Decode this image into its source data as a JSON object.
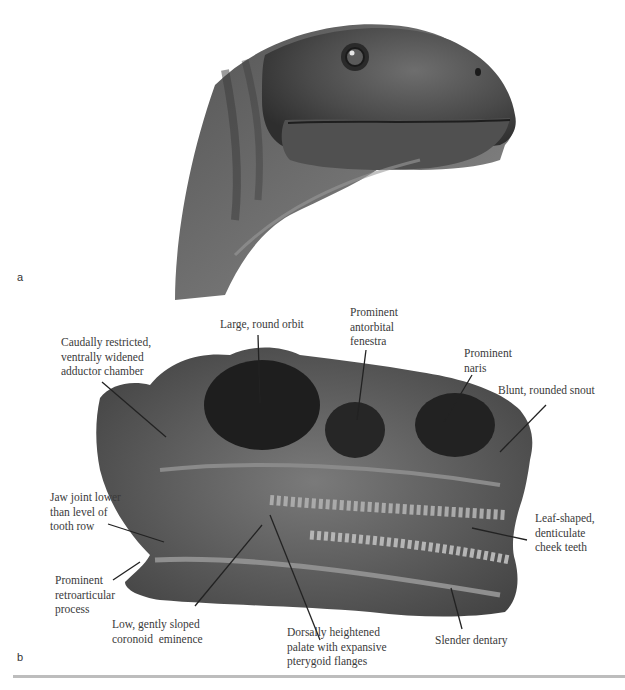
{
  "figure": {
    "panels": [
      {
        "label": "a",
        "content": "life reconstruction of dinosaur head (grayscale illustration)"
      },
      {
        "label": "b",
        "content": "fossil skull in lateral view with anatomical callouts"
      }
    ],
    "panel_a": {
      "label": "a"
    },
    "panel_b": {
      "label": "b",
      "callouts": [
        {
          "id": "adductor",
          "text": "Caudally restricted,\nventrally widened\nadductor chamber"
        },
        {
          "id": "orbit",
          "text": "Large, round orbit"
        },
        {
          "id": "antorbital",
          "text": "Prominent\nantorbital\nfenestra"
        },
        {
          "id": "naris",
          "text": "Prominent\nnaris"
        },
        {
          "id": "snout",
          "text": "Blunt, rounded snout"
        },
        {
          "id": "jaw-joint",
          "text": "Jaw joint lower\nthan level of\ntooth row"
        },
        {
          "id": "cheek-teeth",
          "text": "Leaf-shaped,\ndenticulate\ncheek teeth"
        },
        {
          "id": "retroarticular",
          "text": "Prominent\nretroarticular\nprocess"
        },
        {
          "id": "coronoid",
          "text": "Low, gently sloped\ncoronoid  eminence"
        },
        {
          "id": "palate",
          "text": "Dorsally heightened\npalate with expansive\npterygoid flanges"
        },
        {
          "id": "dentary",
          "text": "Slender dentary"
        }
      ]
    },
    "colors": {
      "ink": "#3a3a3a",
      "divider": "#bdbdbd",
      "background": "#ffffff"
    }
  }
}
